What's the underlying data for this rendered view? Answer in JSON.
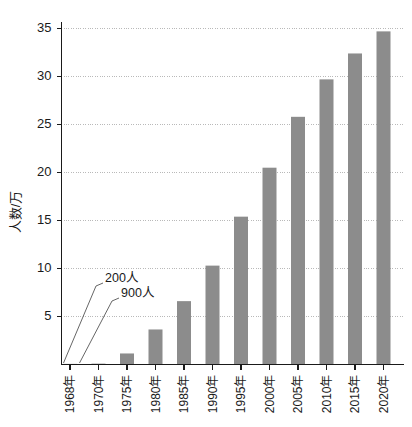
{
  "chart_data": {
    "type": "bar",
    "title": "",
    "subtitle": "",
    "xlabel": "",
    "ylabel": "人数/万",
    "ylim": [
      0,
      36
    ],
    "yticks": [
      0,
      5,
      10,
      15,
      20,
      25,
      30,
      35
    ],
    "ytick_labels": [
      "",
      "5",
      "10",
      "15",
      "20",
      "25",
      "30",
      "35"
    ],
    "grid": true,
    "grid_axis": "y",
    "legend": "none",
    "bar_color": "#8c8c8c",
    "categories": [
      "1968年",
      "1970年",
      "1975年",
      "1980年",
      "1985年",
      "1990年",
      "1995年",
      "2000年",
      "2005年",
      "2010年",
      "2015年",
      "2020年"
    ],
    "values": [
      0.02,
      0.09,
      1.15,
      3.65,
      6.6,
      10.3,
      15.4,
      20.5,
      25.8,
      29.7,
      32.4,
      34.7
    ],
    "annotations": [
      {
        "text": "200人",
        "target_category": "1968年"
      },
      {
        "text": "900人",
        "target_category": "1970年"
      }
    ]
  },
  "figure": {
    "background": "#ffffff",
    "axis_color": "#1a1a1a",
    "gridline_color": "#b9b9b9"
  }
}
